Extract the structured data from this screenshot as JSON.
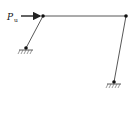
{
  "diagram": {
    "type": "portal-frame",
    "load": {
      "symbol": "P",
      "subscript": "u",
      "direction": "right"
    },
    "nodes": [
      {
        "id": "A",
        "x": 43,
        "y": 16,
        "kind": "pin-joint"
      },
      {
        "id": "B",
        "x": 126,
        "y": 16,
        "kind": "pin-joint"
      },
      {
        "id": "C",
        "x": 26,
        "y": 48,
        "kind": "pinned-support"
      },
      {
        "id": "D",
        "x": 114,
        "y": 82,
        "kind": "pinned-support"
      }
    ],
    "members": [
      {
        "from": "A",
        "to": "B",
        "name": "beam"
      },
      {
        "from": "A",
        "to": "C",
        "name": "left-column"
      },
      {
        "from": "B",
        "to": "D",
        "name": "right-column"
      }
    ],
    "colors": {
      "line": "#222222",
      "background": "#ffffff"
    }
  }
}
